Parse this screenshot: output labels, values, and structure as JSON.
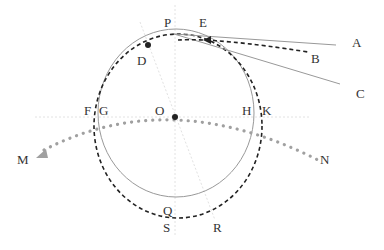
{
  "diagram": {
    "colors": {
      "background": "#ffffff",
      "solid_circle": "#999999",
      "dashed_circle": "#222222",
      "tangent_lines": "#999999",
      "dotted_path": "#a0a0a0",
      "axis_lines": "#dddddd",
      "points": "#222222",
      "label": "#333333"
    },
    "labels": {
      "P": "P",
      "E": "E",
      "A": "A",
      "B": "B",
      "C": "C",
      "D": "D",
      "F": "F",
      "G": "G",
      "O": "O",
      "H": "H",
      "K": "K",
      "M": "M",
      "N": "N",
      "Q": "Q",
      "S": "S",
      "R": "R"
    }
  }
}
